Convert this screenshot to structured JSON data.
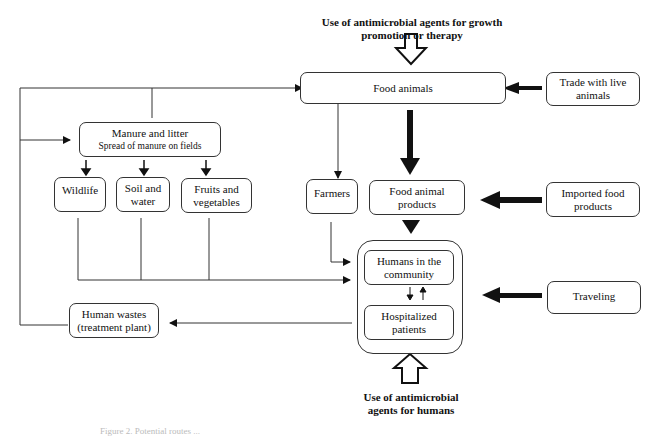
{
  "labels": {
    "top_use": "Use of antimicrobial agents for growth promotion or therapy",
    "bottom_use": "Use of antimicrobial agents for humans"
  },
  "nodes": {
    "food_animals": "Food animals",
    "trade_live_animals": "Trade with live animals",
    "manure_title": "Manure and litter",
    "manure_sub": "Spread of manure on fields",
    "wildlife": "Wildlife",
    "soil_water": "Soil and water",
    "fruits_vegetables": "Fruits and vegetables",
    "farmers": "Farmers",
    "food_animal_products": "Food animal products",
    "imported_food_products": "Imported food products",
    "humans_community": "Humans in the community",
    "hospitalized_patients": "Hospitalized patients",
    "traveling": "Traveling",
    "human_wastes": "Human wastes (treatment plant)"
  },
  "caption": "Figure 2. Potential routes ..."
}
